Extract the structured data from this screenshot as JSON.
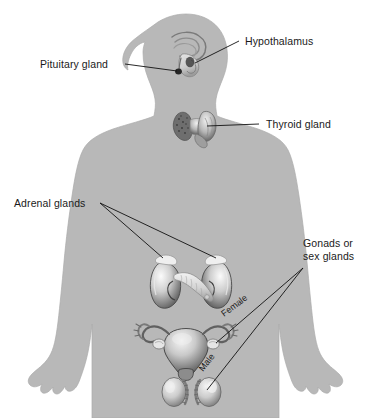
{
  "figure": {
    "background_color": "#ffffff",
    "body_silhouette_color": "#b8b8b8",
    "body_outline_color": "#ababab",
    "leader_line_color": "#111111",
    "label_text_color": "#1a1a1a"
  },
  "labels": {
    "hypothalamus": "Hypothalamus",
    "pituitary_gland": "Pituitary gland",
    "thyroid_gland": "Thyroid gland",
    "adrenal_glands": "Adrenal glands",
    "gonads_line1": "Gonads or",
    "gonads_line2": "sex glands",
    "female": "Female",
    "male": "Male"
  },
  "organs": [
    {
      "name": "brain-hypothalamus",
      "label": "Hypothalamus"
    },
    {
      "name": "pituitary-gland",
      "label": "Pituitary gland"
    },
    {
      "name": "thyroid-gland",
      "label": "Thyroid gland"
    },
    {
      "name": "adrenal-gland-left",
      "label": "Adrenal glands"
    },
    {
      "name": "adrenal-gland-right",
      "label": "Adrenal glands"
    },
    {
      "name": "kidney-left",
      "label": "Kidney"
    },
    {
      "name": "kidney-right",
      "label": "Kidney"
    },
    {
      "name": "pancreas",
      "label": "Pancreas"
    },
    {
      "name": "uterus-ovaries",
      "label": "Female"
    },
    {
      "name": "testes",
      "label": "Male"
    }
  ]
}
